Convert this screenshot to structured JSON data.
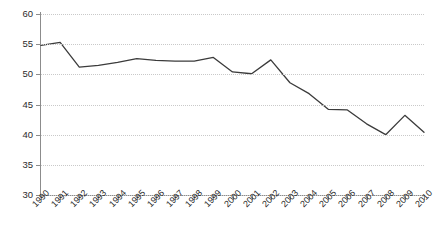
{
  "chart_data": {
    "type": "line",
    "title": "",
    "subtitle": "",
    "xlabel": "",
    "ylabel": "",
    "xlim": [
      1990,
      2010
    ],
    "ylim": [
      30,
      60
    ],
    "yticks": [
      30,
      35,
      40,
      45,
      50,
      55,
      60
    ],
    "grid": "horizontal-dotted",
    "legend": "none",
    "categories": [
      "1990",
      "1991",
      "1992",
      "1993",
      "1994",
      "1995",
      "1996",
      "1997",
      "1998",
      "1999",
      "2000",
      "2001",
      "2002",
      "2003",
      "2004",
      "2005",
      "2006",
      "2007",
      "2008",
      "2009",
      "2010"
    ],
    "series": [
      {
        "name": "series-1",
        "color": "#3b3b3b",
        "values": [
          54.8,
          55.3,
          51.2,
          51.5,
          52.0,
          52.6,
          52.3,
          52.2,
          52.2,
          52.8,
          50.4,
          50.1,
          52.4,
          48.6,
          46.8,
          44.2,
          44.1,
          41.8,
          40.0,
          43.2,
          40.4
        ]
      }
    ]
  },
  "axes": {
    "y_tick_labels": [
      "60",
      "55",
      "50",
      "45",
      "40",
      "35",
      "30"
    ],
    "x_tick_labels": [
      "1990",
      "1991",
      "1992",
      "1993",
      "1994",
      "1995",
      "1996",
      "1997",
      "1998",
      "1999",
      "2000",
      "2001",
      "2002",
      "2003",
      "2004",
      "2005",
      "2006",
      "2007",
      "2008",
      "2009",
      "2010"
    ]
  },
  "colors": {
    "line": "#3b3b3b",
    "axis": "#8c8c8c",
    "grid": "#c9c9c9",
    "text": "#2b2b2b",
    "background": "#ffffff"
  }
}
